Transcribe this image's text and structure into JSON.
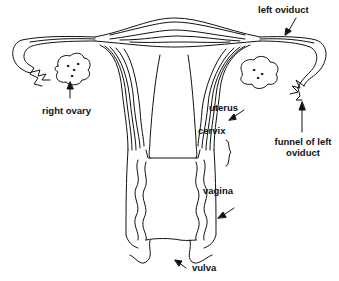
{
  "diagram": {
    "colors": {
      "line": "#111111",
      "background": "#ffffff"
    },
    "labels": {
      "left_oviduct": "left oviduct",
      "right_ovary": "right ovary",
      "uterus": "uterus",
      "cervix": "cervix",
      "funnel_line1": "funnel of left",
      "funnel_line2": "oviduct",
      "vagina": "vagina",
      "vulva": "vulva"
    }
  }
}
